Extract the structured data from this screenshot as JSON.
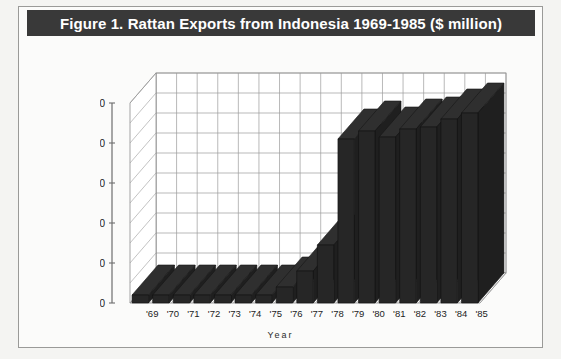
{
  "figure": {
    "title": "Figure 1. Rattan Exports from Indonesia 1969-1985 ($ million)",
    "title_bar_color": "#393939",
    "title_text_color": "#ffffff",
    "background_color": "#f4f4f2",
    "border_color": "#9a9a98"
  },
  "axis": {
    "x_label": "Year",
    "y_ticks": [
      "0",
      "20",
      "40",
      "60",
      "80",
      "100"
    ],
    "x_ticks": [
      "'69",
      "'70",
      "'71",
      "'72",
      "'73",
      "'74",
      "'75",
      "'76",
      "'77",
      "'78",
      "'79",
      "'80",
      "'81",
      "'82",
      "'83",
      "'84",
      "'85"
    ]
  },
  "chart_data": {
    "type": "bar",
    "title": "Figure 1. Rattan Exports from Indonesia 1969-1985 ($ million)",
    "xlabel": "Year",
    "ylabel": "",
    "ylim": [
      0,
      100
    ],
    "yticks": [
      0,
      20,
      40,
      60,
      80,
      100
    ],
    "grid": true,
    "gridline_interval": 10,
    "legend": false,
    "projection": "3d-isometric",
    "bar_color": "#262626",
    "categories": [
      "'69",
      "'70",
      "'71",
      "'72",
      "'73",
      "'74",
      "'75",
      "'76",
      "'77",
      "'78",
      "'79",
      "'80",
      "'81",
      "'82",
      "'83",
      "'84",
      "'85"
    ],
    "values": [
      4,
      4,
      4,
      4,
      4,
      4,
      4,
      8,
      16,
      29,
      82,
      86,
      83,
      87,
      88,
      92,
      95
    ],
    "units": "$ million",
    "series": [
      {
        "name": "Rattan Exports",
        "values": [
          4,
          4,
          4,
          4,
          4,
          4,
          4,
          8,
          16,
          29,
          82,
          86,
          83,
          87,
          88,
          92,
          95
        ]
      }
    ]
  }
}
